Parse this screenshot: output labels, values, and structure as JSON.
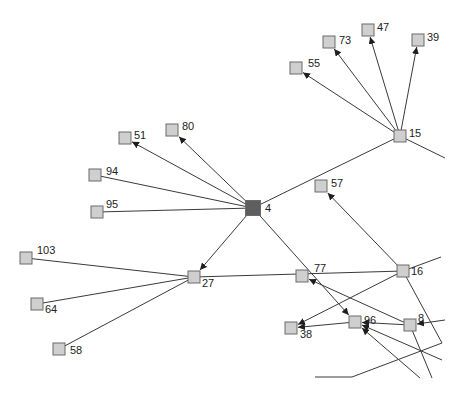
{
  "graph": {
    "type": "directed-network",
    "colors": {
      "node_fill": "#cfcfcf",
      "node_stroke": "#707070",
      "hub_fill": "#5e5e5e",
      "hub_stroke": "#3a3a3a",
      "edge": "#3a3a3a",
      "background": "#ffffff"
    },
    "nodes": [
      {
        "id": "4",
        "label": "4",
        "x": 253,
        "y": 208,
        "size": 15,
        "hub": true,
        "lx": 12,
        "ly": 4
      },
      {
        "id": "15",
        "label": "15",
        "x": 400,
        "y": 136,
        "size": 12,
        "hub": false,
        "lx": 9,
        "ly": 1
      },
      {
        "id": "55",
        "label": "55",
        "x": 296,
        "y": 68,
        "size": 12,
        "hub": false,
        "lx": 12,
        "ly": -1
      },
      {
        "id": "73",
        "label": "73",
        "x": 329,
        "y": 42,
        "size": 12,
        "hub": false,
        "lx": 10,
        "ly": 2
      },
      {
        "id": "47",
        "label": "47",
        "x": 368,
        "y": 30,
        "size": 12,
        "hub": false,
        "lx": 9,
        "ly": 1
      },
      {
        "id": "39",
        "label": "39",
        "x": 418,
        "y": 40,
        "size": 12,
        "hub": false,
        "lx": 9,
        "ly": 1
      },
      {
        "id": "80",
        "label": "80",
        "x": 172,
        "y": 130,
        "size": 12,
        "hub": false,
        "lx": 10,
        "ly": 0
      },
      {
        "id": "51",
        "label": "51",
        "x": 125,
        "y": 138,
        "size": 12,
        "hub": false,
        "lx": 9,
        "ly": 1
      },
      {
        "id": "94",
        "label": "94",
        "x": 95,
        "y": 175,
        "size": 12,
        "hub": false,
        "lx": 11,
        "ly": 0
      },
      {
        "id": "95",
        "label": "95",
        "x": 97,
        "y": 212,
        "size": 12,
        "hub": false,
        "lx": 9,
        "ly": -4
      },
      {
        "id": "57",
        "label": "57",
        "x": 321,
        "y": 186,
        "size": 12,
        "hub": false,
        "lx": 10,
        "ly": 1
      },
      {
        "id": "16",
        "label": "16",
        "x": 403,
        "y": 271,
        "size": 12,
        "hub": false,
        "lx": 8,
        "ly": 4
      },
      {
        "id": "103",
        "label": "103",
        "x": 26,
        "y": 258,
        "size": 12,
        "hub": false,
        "lx": 11,
        "ly": -4
      },
      {
        "id": "27",
        "label": "27",
        "x": 194,
        "y": 277,
        "size": 12,
        "hub": false,
        "lx": 8,
        "ly": 10
      },
      {
        "id": "64",
        "label": "64",
        "x": 37,
        "y": 304,
        "size": 12,
        "hub": false,
        "lx": 8,
        "ly": 9
      },
      {
        "id": "58",
        "label": "58",
        "x": 59,
        "y": 349,
        "size": 12,
        "hub": false,
        "lx": 11,
        "ly": 5
      },
      {
        "id": "77",
        "label": "77",
        "x": 302,
        "y": 276,
        "size": 12,
        "hub": false,
        "lx": 12,
        "ly": -4
      },
      {
        "id": "96",
        "label": "96",
        "x": 355,
        "y": 322,
        "size": 12,
        "hub": false,
        "lx": 9,
        "ly": 2
      },
      {
        "id": "8",
        "label": "8",
        "x": 410,
        "y": 325,
        "size": 12,
        "hub": false,
        "lx": 8,
        "ly": -3
      },
      {
        "id": "38",
        "label": "38",
        "x": 291,
        "y": 328,
        "size": 12,
        "hub": false,
        "lx": 9,
        "ly": 10
      }
    ],
    "edges": [
      {
        "from": "15",
        "to": "55",
        "arrow": true
      },
      {
        "from": "15",
        "to": "73",
        "arrow": true
      },
      {
        "from": "15",
        "to": "47",
        "arrow": true
      },
      {
        "from": "15",
        "to": "39",
        "arrow": true
      },
      {
        "from": "4",
        "to": "15",
        "arrow": false
      },
      {
        "from": "4",
        "to": "80",
        "arrow": true
      },
      {
        "from": "4",
        "to": "51",
        "arrow": true
      },
      {
        "from": "4",
        "to": "94",
        "arrow": false
      },
      {
        "from": "4",
        "to": "95",
        "arrow": false
      },
      {
        "from": "4",
        "to": "27",
        "arrow": true
      },
      {
        "from": "4",
        "to": "96",
        "arrow": true
      },
      {
        "from": "16",
        "to": "57",
        "arrow": true
      },
      {
        "from": "16",
        "to": "27",
        "arrow": false
      },
      {
        "from": "16",
        "to": "38",
        "arrow": true
      },
      {
        "from": "27",
        "to": "103",
        "arrow": false
      },
      {
        "from": "27",
        "to": "64",
        "arrow": false
      },
      {
        "from": "27",
        "to": "58",
        "arrow": false
      },
      {
        "from": "8",
        "to": "77",
        "arrow": true
      },
      {
        "from": "8",
        "to": "96",
        "arrow": true
      },
      {
        "from": "96",
        "to": "38",
        "arrow": true
      }
    ],
    "offscreen_edges": [
      {
        "x1": 400,
        "y1": 136,
        "x2": 445,
        "y2": 158,
        "arrow": false
      },
      {
        "x1": 403,
        "y1": 271,
        "x2": 441,
        "y2": 257,
        "arrow": false
      },
      {
        "x1": 403,
        "y1": 271,
        "x2": 442,
        "y2": 343,
        "arrow": false
      },
      {
        "x1": 442,
        "y1": 343,
        "x2": 352,
        "y2": 377,
        "arrow": false
      },
      {
        "x1": 352,
        "y1": 377,
        "x2": 315,
        "y2": 377,
        "arrow": false
      },
      {
        "x1": 445,
        "y1": 320,
        "x2": 410,
        "y2": 325,
        "arrow": true
      },
      {
        "x1": 410,
        "y1": 325,
        "x2": 432,
        "y2": 378,
        "arrow": false
      },
      {
        "x1": 442,
        "y1": 360,
        "x2": 355,
        "y2": 322,
        "arrow": true
      },
      {
        "x1": 420,
        "y1": 378,
        "x2": 355,
        "y2": 322,
        "arrow": true
      }
    ]
  }
}
